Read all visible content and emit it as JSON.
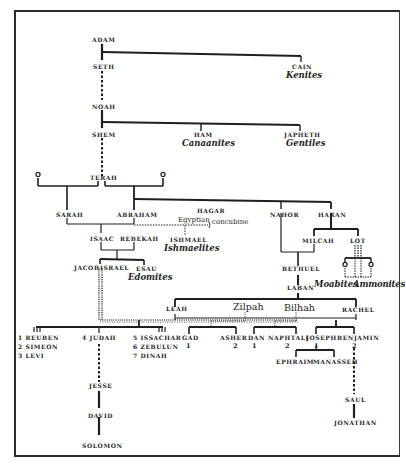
{
  "diagram": {
    "type": "genealogy-tree",
    "persons": {
      "adam": "ADAM",
      "seth": "SETH",
      "cain": "CAIN",
      "noah": "NOAH",
      "shem": "SHEM",
      "ham": "HAM",
      "japheth": "JAPHETH",
      "terah": "TERAH",
      "unnamed_left": "O",
      "unnamed_right": "O",
      "sarah": "SARAH",
      "abraham": "ABRAHAM",
      "hagar": "HAGAR",
      "hagar_note_egyptian": "Egyptian",
      "hagar_note_concubine": "concubine",
      "nahor": "NAHOR",
      "haran": "HARAN",
      "isaac": "ISAAC",
      "rebekah": "REBEKAH",
      "ishmael": "ISHMAEL",
      "milcah": "MILCAH",
      "lot": "LOT",
      "lot_child_1": "O",
      "lot_child_2": "O",
      "jacob": "JACOB",
      "israel": "ISRAEL",
      "esau": "ESAU",
      "bethuel": "BETHUEL",
      "laban": "LABAN",
      "leah": "LEAH",
      "zilpah": "Zilpah",
      "bilhah": "Bilhah",
      "rachel": "RACHEL",
      "reuben": "1 REUBEN",
      "simeon": "2 SIMEON",
      "levi": "3 LEVI",
      "judah": "4 JUDAH",
      "issachar": "5 ISSACHAR",
      "zebulun": "6 ZEBULUN",
      "dinah": "7 DINAH",
      "gad": "GAD",
      "gad_num": "1",
      "asher": "ASHER",
      "asher_num": "2",
      "dan": "DAN",
      "dan_num": "1",
      "naphtali": "NAPHTALI",
      "naphtali_num": "2",
      "joseph": "JOSEPH",
      "joseph_num": "1",
      "benjamin": "BENJAMIN",
      "benjamin_num": "2",
      "ephraim": "EPHRAIM",
      "manasseh": "MANASSEH",
      "jesse": "JESSE",
      "david": "DAVID",
      "solomon": "SOLOMON",
      "saul": "SAUL",
      "jonathan": "JONATHAN"
    },
    "peoples": {
      "kenites": "Kenites",
      "canaanites": "Canaanites",
      "gentiles": "Gentiles",
      "ishmaelites": "Ishmaelites",
      "edomites": "Edomites",
      "moabites": "Moabites",
      "ammonites": "Ammonites"
    },
    "colors": {
      "ink": "#1e1e1e",
      "paper": "#ffffff"
    }
  }
}
